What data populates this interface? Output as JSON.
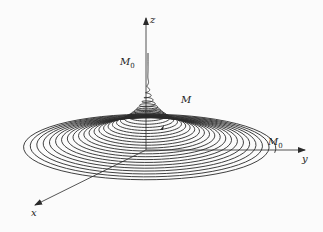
{
  "figure": {
    "type": "conical-spiral-3d",
    "colors": {
      "stroke": "#2a2a2a",
      "background": "#fbfbfb"
    },
    "origin": [
      146,
      150
    ],
    "axes": {
      "z": {
        "label": "z",
        "end": [
          146,
          18
        ]
      },
      "y": {
        "label": "y",
        "end": [
          305,
          150
        ]
      },
      "x": {
        "label": "x",
        "end": [
          35,
          205
        ]
      }
    },
    "labels": {
      "z_axis": "z",
      "y_axis": "y",
      "x_axis": "x",
      "point_m0_top": "M",
      "point_m0_top_sub": "0",
      "point_m": "M",
      "point_m0_end": "M",
      "point_m0_end_sub": "0"
    },
    "spiral": {
      "turns": 30,
      "rx_max": 128,
      "ry_max": 34,
      "height": 95,
      "center_x": 148,
      "base_y": 148
    }
  }
}
